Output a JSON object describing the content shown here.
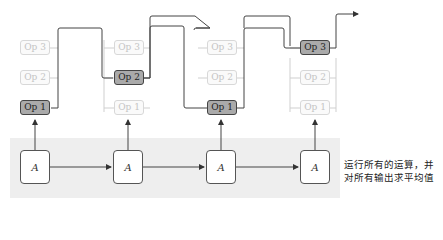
{
  "columns": [
    {
      "ops": [
        {
          "label": "Op 3",
          "active": false
        },
        {
          "label": "Op 2",
          "active": false
        },
        {
          "label": "Op 1",
          "active": true
        }
      ],
      "cell": "A"
    },
    {
      "ops": [
        {
          "label": "Op 3",
          "active": false
        },
        {
          "label": "Op 2",
          "active": true
        },
        {
          "label": "Op 1",
          "active": false
        }
      ],
      "cell": "A"
    },
    {
      "ops": [
        {
          "label": "Op 3",
          "active": false
        },
        {
          "label": "Op 2",
          "active": false
        },
        {
          "label": "Op 1",
          "active": true
        }
      ],
      "cell": "A"
    },
    {
      "ops": [
        {
          "label": "Op 3",
          "active": true
        },
        {
          "label": "Op 2",
          "active": false
        },
        {
          "label": "Op 1",
          "active": false
        }
      ],
      "cell": "A"
    }
  ],
  "caption": {
    "line1": "运行所有的运算，并",
    "line2": "对所有输出求平均值"
  },
  "colors": {
    "band": "#eeeeee",
    "active_op": "#aaaaaa",
    "inactive_op_text": "#c4c4c4",
    "wire": "#444444",
    "faint_wire": "#cccccc"
  }
}
